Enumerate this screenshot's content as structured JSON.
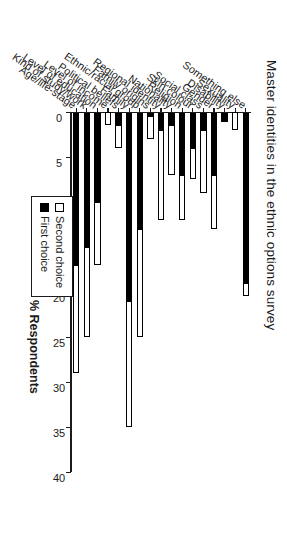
{
  "figure": {
    "title": "Master identities in the ethnic options survey"
  },
  "legend": {
    "items": [
      {
        "label": "Second choice",
        "swatch": "hollow-square",
        "color": "#ffffff"
      },
      {
        "label": "First choice",
        "swatch": "filled-square",
        "color": "#000000"
      }
    ]
  },
  "value_axis": {
    "title": "% Respondents",
    "ticks": [
      "0",
      "5",
      "10",
      "15",
      "20",
      "25",
      "30",
      "35",
      "40"
    ]
  },
  "chart_data": {
    "type": "bar",
    "orientation": "horizontal-stacked",
    "title": "Master identities in the ethnic options survey",
    "xlabel": "",
    "ylabel": "% Respondents",
    "ylim": [
      0,
      40
    ],
    "grid": false,
    "legend_position": "right-inside",
    "categories": [
      "Age/life-stage",
      "Kind of study/work",
      "Level of education",
      "Level of income",
      "Political beliefs",
      "Family",
      "Ethnic/racial group",
      "Family origins",
      "Regional identity",
      "Nationality",
      "Religion",
      "Skin colour",
      "Social class",
      "Gender",
      "Disability",
      "Sexuality",
      "Something else"
    ],
    "series": [
      {
        "name": "First choice",
        "color": "#000000",
        "values": [
          17,
          15,
          10,
          0,
          1.5,
          21,
          13,
          0.5,
          2,
          1.5,
          7,
          4,
          2,
          7,
          1,
          0,
          19
        ]
      },
      {
        "name": "Second choice",
        "color": "#ffffff",
        "values": [
          12,
          10,
          7,
          1.5,
          2.5,
          14,
          12,
          2.5,
          10,
          5.5,
          5,
          3.5,
          7,
          6,
          0,
          2,
          1.5
        ]
      }
    ],
    "totals": [
      29,
      25,
      17,
      1.5,
      4,
      35,
      25,
      3,
      12,
      7,
      12,
      7.5,
      9,
      13,
      1,
      2,
      20.5
    ]
  }
}
